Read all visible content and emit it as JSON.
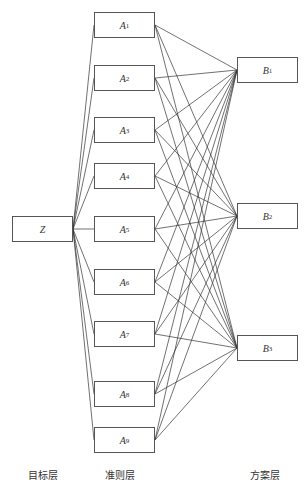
{
  "diagram": {
    "type": "AHP hierarchy structure",
    "goal": {
      "id": "Z",
      "label": "Z",
      "sub": ""
    },
    "criteria": [
      {
        "id": "A1",
        "label": "A",
        "sub": "1"
      },
      {
        "id": "A2",
        "label": "A",
        "sub": "2"
      },
      {
        "id": "A3",
        "label": "A",
        "sub": "3"
      },
      {
        "id": "A4",
        "label": "A",
        "sub": "4"
      },
      {
        "id": "A5",
        "label": "A",
        "sub": "5"
      },
      {
        "id": "A6",
        "label": "A",
        "sub": "6"
      },
      {
        "id": "A7",
        "label": "A",
        "sub": "7"
      },
      {
        "id": "A8",
        "label": "A",
        "sub": "8"
      },
      {
        "id": "A9",
        "label": "A",
        "sub": "9"
      }
    ],
    "alternatives": [
      {
        "id": "B1",
        "label": "B",
        "sub": "1"
      },
      {
        "id": "B2",
        "label": "B",
        "sub": "2"
      },
      {
        "id": "B3",
        "label": "B",
        "sub": "3"
      }
    ],
    "layers": {
      "goal_layer": "目标层",
      "criteria_layer": "准则层",
      "alternative_layer": "方案层"
    },
    "connections": "Z connects to every A; every A connects to every B"
  }
}
